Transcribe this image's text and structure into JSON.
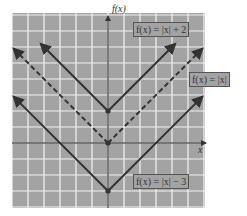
{
  "chart_data": {
    "type": "line",
    "title": "",
    "xlabel": "x",
    "ylabel": "f(x)",
    "xlim": [
      -6,
      6
    ],
    "ylim": [
      -4,
      8
    ],
    "grid": true,
    "legend_position": "inline-boxes",
    "series": [
      {
        "name": "f(x) = |x| + 2",
        "style": "solid",
        "vertex": [
          0,
          2
        ],
        "x": [
          -4,
          0,
          4
        ],
        "y": [
          6,
          2,
          6
        ],
        "label": "f(x) = |x| + 2"
      },
      {
        "name": "f(x) = |x|",
        "style": "dashed",
        "vertex": [
          0,
          0
        ],
        "x": [
          -6,
          0,
          6
        ],
        "y": [
          6,
          0,
          6
        ],
        "label": "f(x) = |x|"
      },
      {
        "name": "f(x) = |x| − 3",
        "style": "solid",
        "vertex": [
          0,
          -3
        ],
        "x": [
          -6,
          0,
          6
        ],
        "y": [
          3,
          -3,
          3
        ],
        "label": "f(x) = |x| − 3"
      }
    ]
  },
  "labels": {
    "y_axis": "f(x)",
    "x_axis": "x",
    "top": "f(x) = |x| + 2",
    "middle": "f(x) = |x|",
    "bottom": "f(x) = |x| − 3"
  },
  "colors": {
    "plot_bg": "#a3a3a3",
    "grid": "#f2f2f2",
    "line": "#333333",
    "axis": "#222222"
  }
}
